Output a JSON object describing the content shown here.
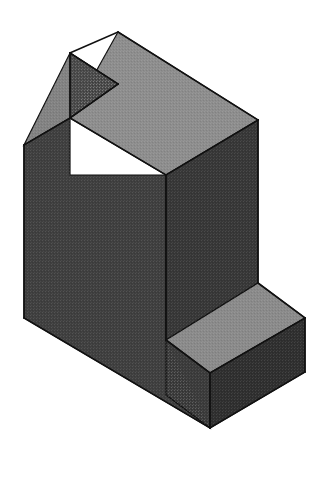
{
  "figure": {
    "kind": "isometric-solid-block",
    "title": "Isometric pictorial of a notched L-shaped block",
    "background_color": "#ffffff",
    "canvas": {
      "width": 325,
      "height": 504
    },
    "edge_color": "#111111",
    "edge_width": 1.6,
    "palette": {
      "top_face": "#8d8d8d",
      "top_face_light": "#949494",
      "step_top_face": "#8a8a8a",
      "notch_floor_face": "#828282",
      "left_front_face": "#3f3f3f",
      "right_front_face": "#373737",
      "notch_inner_face": "#4a4a4a",
      "step_front_face": "#3b3b3b",
      "step_right_face": "#2f2f2f",
      "riser_face": "#3a3a3a"
    },
    "faces": [
      {
        "name": "upper-top-face",
        "label": "Top face of tall plate",
        "fill_key": "top_face",
        "points": "118,32 258,120 166,175 70,118"
      },
      {
        "name": "notch-floor-face",
        "label": "Floor of the top notch",
        "fill_key": "notch_floor_face",
        "points": "70,53 118,84 70,118 24,145"
      },
      {
        "name": "notch-inner-face",
        "label": "Inner vertical wall of notch",
        "fill_key": "notch_inner_face",
        "points": "70,53 118,84 118,84 70,118"
      },
      {
        "name": "left-front-face",
        "label": "Large left-hand front face",
        "fill_key": "left_front_face",
        "points": "24,145 70,118 70,175 166,175 166,340 210,428 24,318"
      },
      {
        "name": "right-front-face",
        "label": "Right-hand front face of tall plate",
        "fill_key": "right_front_face",
        "points": "166,175 258,120 258,283 166,340"
      },
      {
        "name": "step-top-face",
        "label": "Top face of the lower step",
        "fill_key": "step_top_face",
        "points": "166,340 258,283 305,318 210,373"
      },
      {
        "name": "step-front-face",
        "label": "Front face of the lower step",
        "fill_key": "step_front_face",
        "points": "166,340 210,373 210,428 166,395"
      },
      {
        "name": "step-right-face",
        "label": "Right end face of the lower step",
        "fill_key": "step_right_face",
        "points": "210,373 305,318 305,372 210,428"
      }
    ],
    "edges": [
      {
        "name": "edge-top-apex-left",
        "points": "118,32 70,53"
      },
      {
        "name": "edge-top-apex-right",
        "points": "118,32 258,120"
      },
      {
        "name": "edge-notch-left-down",
        "points": "70,53 70,118"
      },
      {
        "name": "edge-notch-inner-down",
        "points": "118,84 118,84"
      },
      {
        "name": "edge-notch-top-in",
        "points": "70,53 118,84"
      },
      {
        "name": "edge-notch-bottom-in",
        "points": "118,84 70,118"
      },
      {
        "name": "edge-notch-floor-left",
        "points": "70,118 24,145"
      },
      {
        "name": "edge-top-front-left",
        "points": "70,118 166,175"
      },
      {
        "name": "edge-top-front-right",
        "points": "258,120 166,175"
      },
      {
        "name": "edge-left-vertical",
        "points": "24,145 24,318"
      },
      {
        "name": "edge-center-vertical",
        "points": "166,175 166,340"
      },
      {
        "name": "edge-right-vertical",
        "points": "258,120 258,283"
      },
      {
        "name": "edge-bottom-left-run",
        "points": "24,318 210,428"
      },
      {
        "name": "edge-step-inner-left",
        "points": "166,340 210,373"
      },
      {
        "name": "edge-step-top-right",
        "points": "258,283 305,318"
      },
      {
        "name": "edge-step-top-front",
        "points": "210,373 305,318"
      },
      {
        "name": "edge-step-right-vertical",
        "points": "305,318 305,372"
      },
      {
        "name": "edge-step-bottom-right",
        "points": "210,428 305,372"
      },
      {
        "name": "edge-step-front-vertical",
        "points": "210,373 210,428"
      }
    ]
  }
}
